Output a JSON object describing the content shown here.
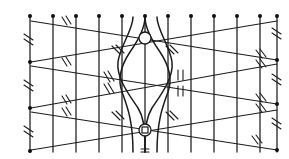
{
  "figure": {
    "kind": "line-diagram",
    "width": 289,
    "height": 159,
    "background_color": "#ffffff",
    "ink_color": "#1c1c1c"
  },
  "colors": {
    "ink": "#1c1c1c",
    "node_fill": "#101010",
    "paper": "#ffffff"
  },
  "grid": {
    "vertical_line_count": 12,
    "vertical_line_x": [
      30,
      53,
      76,
      99,
      122,
      145,
      168,
      191,
      214,
      237,
      260,
      277
    ],
    "vertical_top_y": 17,
    "vertical_bottom_y": 152,
    "left_edge_x": 30,
    "right_edge_x": 277
  },
  "top_nodes": {
    "label": "top boundary dots",
    "count": 12,
    "y": 16,
    "x": [
      30,
      53,
      76,
      99,
      122,
      145,
      168,
      191,
      214,
      237,
      260,
      277
    ],
    "radius": 2.0
  },
  "edge_nodes": {
    "left_x": 30,
    "right_x": 277,
    "left_y": [
      16,
      62,
      108,
      152
    ],
    "right_y": [
      16,
      60,
      104,
      150
    ],
    "radius": 2.0
  },
  "diagonals": [
    {
      "name": "band-1-down",
      "from": [
        31,
        21
      ],
      "to": [
        277,
        60
      ]
    },
    {
      "name": "band-1-up",
      "from": [
        31,
        62
      ],
      "to": [
        277,
        21
      ]
    },
    {
      "name": "band-2-down",
      "from": [
        31,
        66
      ],
      "to": [
        277,
        104
      ]
    },
    {
      "name": "band-2-up",
      "from": [
        31,
        108
      ],
      "to": [
        277,
        64
      ]
    },
    {
      "name": "band-3-down",
      "from": [
        31,
        112
      ],
      "to": [
        277,
        150
      ]
    },
    {
      "name": "band-3-up",
      "from": [
        31,
        150
      ],
      "to": [
        277,
        110
      ]
    }
  ],
  "center_figure": {
    "name": "vesica-lens",
    "center_x": 145,
    "upper_ring": {
      "cx": 145,
      "cy": 38,
      "r": 6
    },
    "lower_ring": {
      "cx": 145,
      "cy": 130,
      "r": 6
    },
    "lens_top_y": 62,
    "lens_bottom_y": 108,
    "lens_half_width": 28
  },
  "tick_marks": {
    "style": "double-hatch",
    "description": "pairs of short slanted strokes marking congruent segments",
    "count": 26
  },
  "legend": {
    "dot": "vertex node",
    "double_hatch": "equal-length segment mark",
    "ring": "intersection marker",
    "square": "right-angle / junction marker"
  }
}
